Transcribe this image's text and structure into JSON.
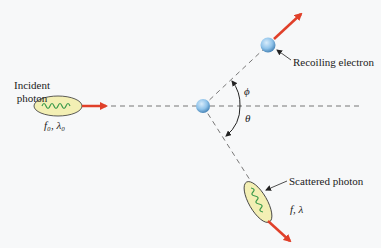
{
  "diagram": {
    "incident_photon": {
      "label_line1": "Incident",
      "label_line2": "photon",
      "params": "f₀, λ₀"
    },
    "recoiling_electron": {
      "label": "Recoiling electron"
    },
    "scattered_photon": {
      "label": "Scattered photon",
      "params": "f, λ"
    },
    "angles": {
      "phi": "ϕ",
      "theta": "θ"
    },
    "colors": {
      "arrow": "#e0402a",
      "electron": "#8fc3ea",
      "photon_fill": "#f3efb4",
      "wave": "#3a9a4a",
      "dash": "#777777",
      "background": "#f7f8f9"
    }
  }
}
